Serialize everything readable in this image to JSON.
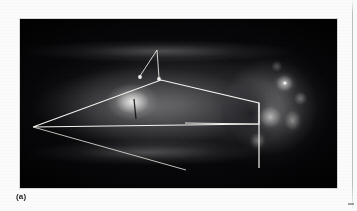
{
  "figure": {
    "caption_label": "(a)",
    "modality_name": "radiograph",
    "panel_background_color": "#07070a",
    "annotation_color": "#f2f2ee",
    "paper_color": "#fbfbfb"
  },
  "panel": {
    "left": 20,
    "top": 19,
    "width": 317,
    "height": 169
  },
  "annotations": {
    "measurement_wedge": {
      "name": "angle-measurement-wedge",
      "color": "#f4f4f0",
      "stroke_width": 1.1,
      "vertices": [
        {
          "x": 13,
          "y": 108
        },
        {
          "x": 141,
          "y": 61
        },
        {
          "x": 239,
          "y": 84
        },
        {
          "x": 239,
          "y": 105
        },
        {
          "x": 13,
          "y": 108
        }
      ]
    },
    "upper_long_line": {
      "name": "upper-reference-line",
      "color": "#f4f4f0",
      "stroke_width": 1.1,
      "x1": 13,
      "y1": 108,
      "x2": 239,
      "y2": 84
    },
    "lower_long_line": {
      "name": "lower-reference-line",
      "color": "#f4f4f0",
      "stroke_width": 1.1,
      "x1": 13,
      "y1": 108,
      "x2": 239,
      "y2": 105
    },
    "oblique_line": {
      "name": "oblique-reference-line",
      "color": "#dedeci",
      "stroke_width": 1.0,
      "x1": 13,
      "y1": 108,
      "x2": 166,
      "y2": 151
    },
    "vertical_line": {
      "name": "vertical-reference-line",
      "color": "#f4f4f0",
      "stroke_width": 1.2,
      "x1": 239,
      "y1": 84,
      "x2": 239,
      "y2": 149
    },
    "arrow_pair": {
      "name": "paired-arrow-marker",
      "color": "#e8e8e4",
      "apex": {
        "x": 137,
        "y": 31
      },
      "tip_left": {
        "x": 120,
        "y": 58
      },
      "tip_right": {
        "x": 139,
        "y": 60
      },
      "head_radius": 1.8
    }
  },
  "features": {
    "bright_focus_label": "hyperdense-focus",
    "cranium_label": "posterior-cranial-mass",
    "body_label": "rostral-body",
    "trabeculae_label": "trabecular-network"
  }
}
